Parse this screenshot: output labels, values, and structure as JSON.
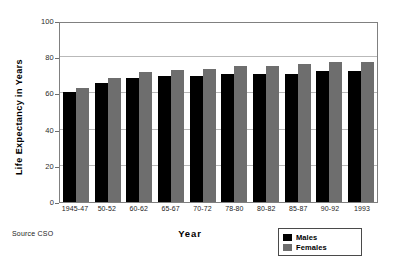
{
  "figure": {
    "title_remnant": "Life Expectancy",
    "source_note": "Source CSO"
  },
  "legend": {
    "position": "bottom-right",
    "entries": [
      {
        "label": "Males",
        "color": "#000000"
      },
      {
        "label": "Females",
        "color": "#6e6e6e"
      }
    ]
  },
  "chart_data": {
    "type": "bar",
    "title": "",
    "xlabel": "Year",
    "ylabel": "Life Expectancy in Years",
    "categories": [
      "1945-47",
      "50-52",
      "60-62",
      "65-67",
      "70-72",
      "78-80",
      "80-82",
      "85-87",
      "90-92",
      "1993"
    ],
    "series": [
      {
        "name": "Males",
        "color": "#000000",
        "values": [
          61,
          65.5,
          68.5,
          69.5,
          69.5,
          70.5,
          70.5,
          71,
          72.5,
          72.5
        ]
      },
      {
        "name": "Females",
        "color": "#6e6e6e",
        "values": [
          63,
          68.5,
          72,
          73,
          73.5,
          75,
          75,
          76.5,
          77.5,
          77.5
        ]
      }
    ],
    "ylim": [
      0,
      100
    ],
    "yticks": [
      0,
      20,
      40,
      60,
      80,
      100
    ],
    "grid": true,
    "legend_position": "bottom-right"
  }
}
